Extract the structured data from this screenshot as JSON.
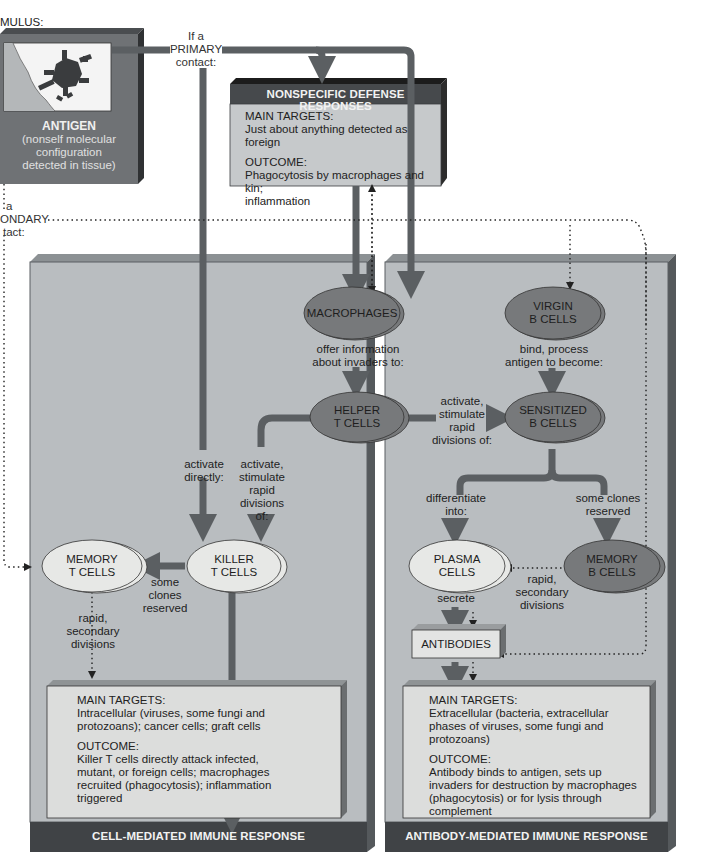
{
  "colors": {
    "panel_fill": "#b9bdc0",
    "panel_edge": "#5a5f63",
    "panel_dark": "#3f4245",
    "arrow": "#5b5f62",
    "oval_dark": "#77797b",
    "oval_light": "#e7e8e6",
    "outcome_box": "#d9dbdb",
    "antigen_box": "#6f7275"
  },
  "stimulus": {
    "label_fragment": "MULUS:",
    "antigen_title": "ANTIGEN",
    "antigen_desc": [
      "(nonself molecular",
      "configuration",
      "detected in tissue)"
    ]
  },
  "primary_contact": [
    "If a",
    "PRIMARY",
    "contact:"
  ],
  "secondary_contact": [
    "a",
    "ONDARY",
    "tact:"
  ],
  "nonspecific": {
    "title": "NONSPECIFIC DEFENSE RESPONSES",
    "targets_label": "MAIN TARGETS:",
    "targets_text": "Just about anything detected as foreign",
    "outcome_label": "OUTCOME:",
    "outcome_text": [
      "Phagocytosis by macrophages and kin;",
      "inflammation"
    ]
  },
  "cells": {
    "macrophages": "MACROPHAGES",
    "virgin_b": [
      "VIRGIN",
      "B CELLS"
    ],
    "helper_t": [
      "HELPER",
      "T CELLS"
    ],
    "sensitized_b": [
      "SENSITIZED",
      "B CELLS"
    ],
    "killer_t": [
      "KILLER",
      "T CELLS"
    ],
    "memory_t": [
      "MEMORY",
      "T CELLS"
    ],
    "plasma": [
      "PLASMA",
      "CELLS"
    ],
    "memory_b": [
      "MEMORY",
      "B CELLS"
    ],
    "antibodies": "ANTIBODIES"
  },
  "labels": {
    "offer_info": [
      "offer information",
      "about invaders to:"
    ],
    "bind_process": [
      "bind, process",
      "antigen to become:"
    ],
    "activate_stimulate_b": [
      "activate,",
      "stimulate",
      "rapid",
      "divisions of:"
    ],
    "activate_directly": [
      "activate",
      "directly:"
    ],
    "activate_stimulate_t": [
      "activate,",
      "stimulate",
      "rapid",
      "divisions",
      "of:"
    ],
    "some_clones_t": [
      "some",
      "clones",
      "reserved"
    ],
    "rapid_secondary_t": [
      "rapid,",
      "secondary",
      "divisions"
    ],
    "differentiate": [
      "differentiate",
      "into:"
    ],
    "some_clones_b": [
      "some clones",
      "reserved"
    ],
    "rapid_secondary_b": [
      "rapid,",
      "secondary",
      "divisions"
    ],
    "secrete": "secrete"
  },
  "cell_mediated": {
    "title": "CELL-MEDIATED IMMUNE RESPONSE",
    "targets_label": "MAIN TARGETS:",
    "targets_text": [
      "Intracellular (viruses, some fungi and",
      "protozoans); cancer cells; graft cells"
    ],
    "outcome_label": "OUTCOME:",
    "outcome_text": [
      "Killer T cells directly attack infected,",
      "mutant, or foreign cells; macrophages",
      "recruited (phagocytosis); inflammation",
      "triggered"
    ]
  },
  "antibody_mediated": {
    "title": "ANTIBODY-MEDIATED IMMUNE RESPONSE",
    "targets_label": "MAIN TARGETS:",
    "targets_text": [
      "Extracellular (bacteria, extracellular",
      "phases of viruses, some fungi and",
      "protozoans)"
    ],
    "outcome_label": "OUTCOME:",
    "outcome_text": [
      "Antibody binds to antigen, sets up",
      "invaders for destruction by macrophages",
      "(phagocytosis) or for lysis through",
      "complement"
    ]
  }
}
